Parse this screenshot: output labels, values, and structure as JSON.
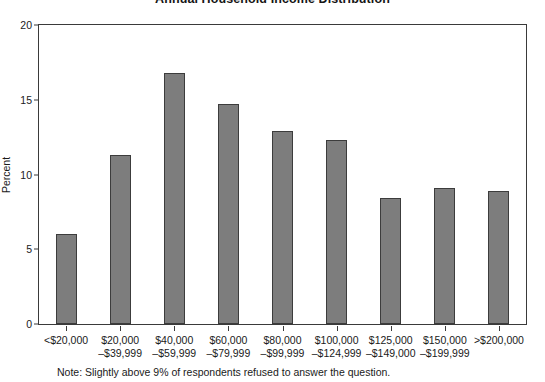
{
  "chart_data": {
    "type": "bar",
    "title": "Annual Household Income Distribution",
    "xlabel": "",
    "ylabel": "Percent",
    "ylim": [
      0,
      20
    ],
    "yticks": [
      0,
      5,
      10,
      15,
      20
    ],
    "grid": false,
    "legend": null,
    "categories": [
      "<$20,000",
      "$20,000–$39,999",
      "$40,000–$59,999",
      "$60,000–$79,999",
      "$80,000–$99,999",
      "$100,000–$124,999",
      "$125,000–$149,000",
      "$150,000–$199,999",
      ">$200,000"
    ],
    "category_lines": [
      {
        "line1": "<$20,000",
        "line2": ""
      },
      {
        "line1": "$20,000",
        "line2": "–$39,999"
      },
      {
        "line1": "$40,000",
        "line2": "–$59,999"
      },
      {
        "line1": "$60,000",
        "line2": "–$79,999"
      },
      {
        "line1": "$80,000",
        "line2": "–$99,999"
      },
      {
        "line1": "$100,000",
        "line2": "–$124,999"
      },
      {
        "line1": "$125,000",
        "line2": "–$149,000"
      },
      {
        "line1": "$150,000",
        "line2": "–$199,999"
      },
      {
        "line1": ">$200,000",
        "line2": ""
      }
    ],
    "values": [
      6.0,
      11.3,
      16.8,
      14.7,
      12.9,
      12.3,
      8.4,
      9.1,
      8.9
    ],
    "bar_color": "#7d7d7d",
    "bar_edge_color": "#3c3c3c",
    "axis_color": "#3a3a3a"
  },
  "footnote": "Note: Slightly above 9% of respondents refused to answer the question."
}
